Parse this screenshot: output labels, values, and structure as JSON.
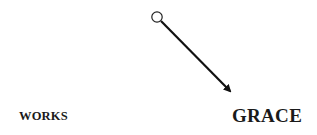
{
  "diagram": {
    "nodes": [
      {
        "id": "works",
        "label": "WORKS"
      },
      {
        "id": "grace",
        "label": "GRACE"
      }
    ],
    "connector": {
      "start_marker": "open-circle",
      "end_marker": "arrowhead",
      "direction": "down-right",
      "color": "#111111"
    }
  }
}
